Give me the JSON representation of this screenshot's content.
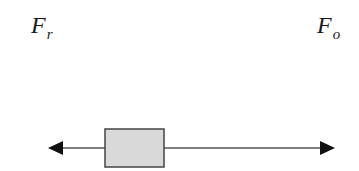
{
  "diagram": {
    "type": "free-body force diagram",
    "labels": {
      "left_force": {
        "symbol": "F",
        "subscript": "r"
      },
      "right_force": {
        "symbol": "F",
        "subscript": "o"
      }
    },
    "colors": {
      "line": "#555555",
      "arrowhead": "#111111",
      "box_fill": "#d9d9d9",
      "box_stroke": "#444444",
      "text": "#1a1a1a"
    }
  }
}
